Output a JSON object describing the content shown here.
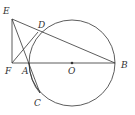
{
  "diagram": {
    "type": "geometry",
    "points": {
      "E": {
        "label": "E",
        "x": 12,
        "y": 19
      },
      "D": {
        "label": "D",
        "x": 38,
        "y": 32
      },
      "F": {
        "label": "F",
        "x": 12,
        "y": 63
      },
      "A": {
        "label": "A",
        "x": 29,
        "y": 63
      },
      "O": {
        "label": "O",
        "x": 72,
        "y": 63
      },
      "B": {
        "label": "B",
        "x": 115,
        "y": 63
      },
      "C": {
        "label": "C",
        "x": 40,
        "y": 93
      }
    },
    "circle": {
      "center": "O",
      "radius": 43
    },
    "segments": [
      "EF",
      "EB",
      "FB",
      "FD",
      "EC",
      "AC"
    ],
    "colors": {
      "stroke": "#333333",
      "background": "#ffffff"
    }
  }
}
